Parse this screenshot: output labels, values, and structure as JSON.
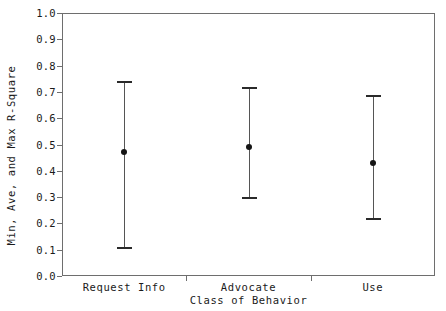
{
  "chart_data": {
    "type": "scatter",
    "title": "",
    "xlabel": "Class of Behavior",
    "ylabel": "Min, Ave, and Max R-Square",
    "categories": [
      "Request Info",
      "Advocate",
      "Use"
    ],
    "ylim": [
      0.0,
      1.0
    ],
    "yticks": [
      "1.0",
      "0.9",
      "0.8",
      "0.7",
      "0.6",
      "0.5",
      "0.4",
      "0.3",
      "0.2",
      "0.1",
      "0.0"
    ],
    "ytick_values": [
      1.0,
      0.9,
      0.8,
      0.7,
      0.6,
      0.5,
      0.4,
      0.3,
      0.2,
      0.1,
      0.0
    ],
    "grid": false,
    "legend": "none",
    "series": [
      {
        "name": "Min R-Square",
        "values": [
          0.11,
          0.3,
          0.22
        ]
      },
      {
        "name": "Ave R-Square",
        "values": [
          0.47,
          0.49,
          0.43
        ]
      },
      {
        "name": "Max R-Square",
        "values": [
          0.74,
          0.72,
          0.69
        ]
      }
    ],
    "points": [
      {
        "category": "Request Info",
        "min": 0.11,
        "ave": 0.47,
        "max": 0.74
      },
      {
        "category": "Advocate",
        "min": 0.3,
        "ave": 0.49,
        "max": 0.72
      },
      {
        "category": "Use",
        "min": 0.22,
        "ave": 0.43,
        "max": 0.69
      }
    ],
    "colors": {
      "axis": "#6e6e6e",
      "bar": "#555555",
      "cap": "#2a2a2a",
      "marker": "#151515",
      "background": "#ffffff"
    }
  }
}
